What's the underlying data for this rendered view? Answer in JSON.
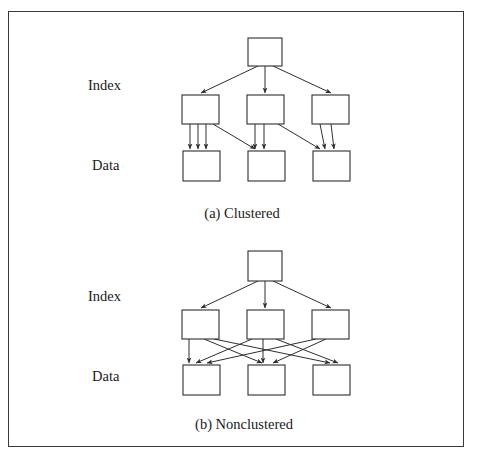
{
  "figure": {
    "background_color": "#ffffff",
    "border_color": "#3a3a3a",
    "line_color": "#2e2e2e",
    "text_color": "#1a1a1a"
  },
  "panels": [
    {
      "id": "clustered",
      "caption": "(a) Clustered",
      "caption_x": 242,
      "caption_y": 218,
      "labels": [
        {
          "text": "Index",
          "x": 88,
          "y": 90
        },
        {
          "text": "Data",
          "x": 92,
          "y": 170
        }
      ],
      "root": {
        "x": 248,
        "y": 38,
        "w": 34,
        "h": 28
      },
      "index_nodes": [
        {
          "x": 182,
          "y": 95,
          "w": 37,
          "h": 29
        },
        {
          "x": 247,
          "y": 95,
          "w": 37,
          "h": 29
        },
        {
          "x": 312,
          "y": 95,
          "w": 37,
          "h": 29
        }
      ],
      "data_nodes": [
        {
          "x": 183,
          "y": 151,
          "w": 37,
          "h": 30
        },
        {
          "x": 248,
          "y": 151,
          "w": 37,
          "h": 30
        },
        {
          "x": 313,
          "y": 151,
          "w": 37,
          "h": 30
        }
      ],
      "root_edges": [
        {
          "from_x": 258,
          "from_y": 66,
          "to_x": 201,
          "to_y": 93
        },
        {
          "from_x": 265,
          "from_y": 66,
          "to_x": 265,
          "to_y": 93
        },
        {
          "from_x": 273,
          "from_y": 66,
          "to_x": 331,
          "to_y": 93
        }
      ],
      "leaf_edges": [
        {
          "from_x": 190,
          "from_y": 124,
          "to_x": 190,
          "to_y": 149
        },
        {
          "from_x": 198,
          "from_y": 124,
          "to_x": 198,
          "to_y": 149
        },
        {
          "from_x": 206,
          "from_y": 124,
          "to_x": 206,
          "to_y": 149
        },
        {
          "from_x": 213,
          "from_y": 124,
          "to_x": 255,
          "to_y": 149
        },
        {
          "from_x": 255,
          "from_y": 124,
          "to_x": 255,
          "to_y": 149
        },
        {
          "from_x": 264,
          "from_y": 124,
          "to_x": 264,
          "to_y": 149
        },
        {
          "from_x": 278,
          "from_y": 124,
          "to_x": 320,
          "to_y": 149
        },
        {
          "from_x": 320,
          "from_y": 124,
          "to_x": 325,
          "to_y": 149
        },
        {
          "from_x": 331,
          "from_y": 124,
          "to_x": 334,
          "to_y": 149
        }
      ]
    },
    {
      "id": "nonclustered",
      "caption": "(b) Nonclustered",
      "caption_x": 244,
      "caption_y": 429,
      "labels": [
        {
          "text": "Index",
          "x": 88,
          "y": 301
        },
        {
          "text": "Data",
          "x": 92,
          "y": 381
        }
      ],
      "root": {
        "x": 248,
        "y": 251,
        "w": 34,
        "h": 30
      },
      "index_nodes": [
        {
          "x": 182,
          "y": 310,
          "w": 37,
          "h": 29
        },
        {
          "x": 247,
          "y": 310,
          "w": 37,
          "h": 29
        },
        {
          "x": 312,
          "y": 310,
          "w": 37,
          "h": 29
        }
      ],
      "data_nodes": [
        {
          "x": 183,
          "y": 365,
          "w": 37,
          "h": 30
        },
        {
          "x": 248,
          "y": 365,
          "w": 37,
          "h": 30
        },
        {
          "x": 313,
          "y": 365,
          "w": 37,
          "h": 30
        }
      ],
      "root_edges": [
        {
          "from_x": 258,
          "from_y": 281,
          "to_x": 201,
          "to_y": 308
        },
        {
          "from_x": 265,
          "from_y": 281,
          "to_x": 265,
          "to_y": 308
        },
        {
          "from_x": 273,
          "from_y": 281,
          "to_x": 331,
          "to_y": 308
        }
      ],
      "leaf_edges": [
        {
          "from_x": 189,
          "from_y": 339,
          "to_x": 189,
          "to_y": 363
        },
        {
          "from_x": 204,
          "from_y": 339,
          "to_x": 262,
          "to_y": 363
        },
        {
          "from_x": 214,
          "from_y": 339,
          "to_x": 330,
          "to_y": 363
        },
        {
          "from_x": 252,
          "from_y": 339,
          "to_x": 196,
          "to_y": 363
        },
        {
          "from_x": 263,
          "from_y": 339,
          "to_x": 263,
          "to_y": 363
        },
        {
          "from_x": 276,
          "from_y": 339,
          "to_x": 338,
          "to_y": 363
        },
        {
          "from_x": 316,
          "from_y": 339,
          "to_x": 207,
          "to_y": 363
        },
        {
          "from_x": 326,
          "from_y": 339,
          "to_x": 273,
          "to_y": 363
        }
      ]
    }
  ]
}
